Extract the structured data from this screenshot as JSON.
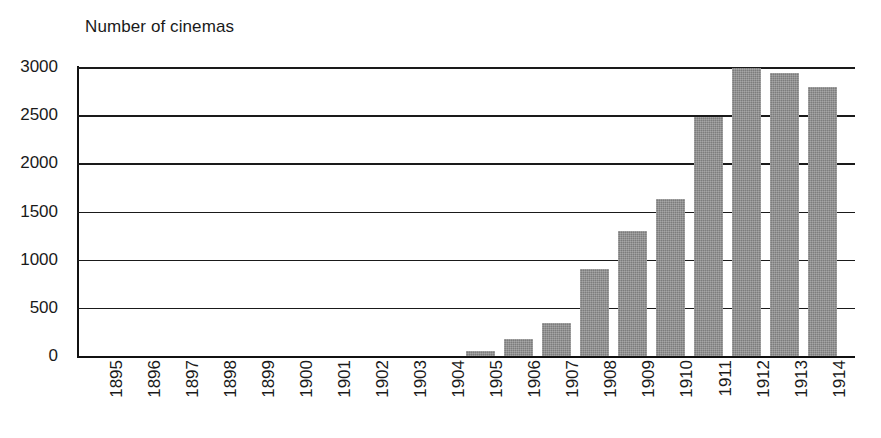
{
  "chart_data": {
    "type": "bar",
    "title": "Number of cinemas",
    "xlabel": "",
    "ylabel": "",
    "ylim": [
      0,
      3000
    ],
    "ytick_values": [
      0,
      500,
      1000,
      1500,
      2000,
      2500,
      3000
    ],
    "ytick_labels": [
      "0",
      "500",
      "1000",
      "1500",
      "2000",
      "2500",
      "3000"
    ],
    "grid": true,
    "legend": false,
    "bar_color": "#8a8a8a",
    "categories": [
      "1895",
      "1896",
      "1897",
      "1898",
      "1899",
      "1900",
      "1901",
      "1902",
      "1903",
      "1904",
      "1905",
      "1906",
      "1907",
      "1908",
      "1909",
      "1910",
      "1911",
      "1912",
      "1913",
      "1914"
    ],
    "values": [
      0,
      0,
      0,
      0,
      0,
      0,
      0,
      0,
      0,
      0,
      50,
      180,
      340,
      900,
      1300,
      1630,
      2480,
      2990,
      2940,
      2790
    ]
  }
}
